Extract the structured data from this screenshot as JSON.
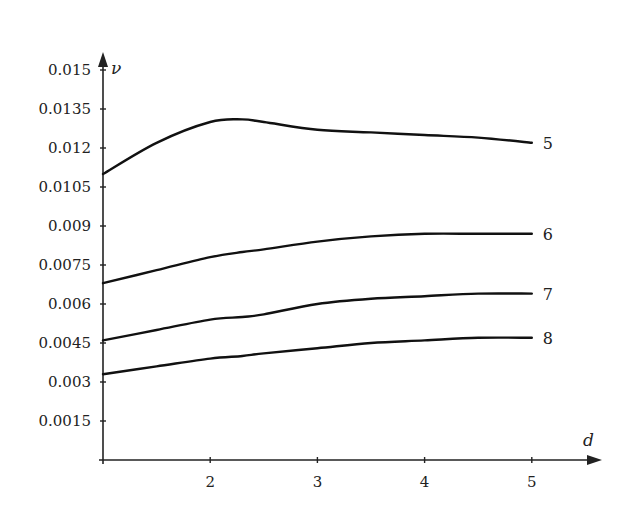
{
  "chart_data": {
    "type": "line",
    "title": "",
    "xlabel": "d",
    "ylabel": "ν",
    "xlim": [
      1,
      5.4
    ],
    "ylim": [
      0,
      0.0162
    ],
    "grid": false,
    "legend": "inline labels at right end of each curve",
    "x_ticks": [
      2,
      3,
      4,
      5
    ],
    "x_tick_labels": [
      "2",
      "3",
      "4",
      "5"
    ],
    "y_ticks": [
      0.0015,
      0.003,
      0.0045,
      0.006,
      0.0075,
      0.009,
      0.0105,
      0.012,
      0.0135,
      0.015
    ],
    "y_tick_labels": [
      "0.0015",
      "0.003",
      "0.0045",
      "0.006",
      "0.0075",
      "0.009",
      "0.0105",
      "0.012",
      "0.0135",
      "0.015"
    ],
    "x": [
      1,
      1.5,
      2,
      2.3,
      2.5,
      3,
      3.5,
      4,
      4.5,
      5
    ],
    "series": [
      {
        "name": "5",
        "values": [
          0.011,
          0.0122,
          0.013,
          0.0131,
          0.013,
          0.0127,
          0.0126,
          0.0125,
          0.0124,
          0.0122
        ]
      },
      {
        "name": "6",
        "values": [
          0.0068,
          0.0073,
          0.0078,
          0.008,
          0.0081,
          0.0084,
          0.0086,
          0.0087,
          0.0087,
          0.0087
        ]
      },
      {
        "name": "7",
        "values": [
          0.0046,
          0.005,
          0.0054,
          0.0055,
          0.0056,
          0.006,
          0.0062,
          0.0063,
          0.0064,
          0.0064
        ]
      },
      {
        "name": "8",
        "values": [
          0.0033,
          0.0036,
          0.0039,
          0.004,
          0.0041,
          0.0043,
          0.0045,
          0.0046,
          0.0047,
          0.0047
        ]
      }
    ]
  },
  "style": {
    "line_color": "#111111",
    "axis_color": "#222222"
  }
}
